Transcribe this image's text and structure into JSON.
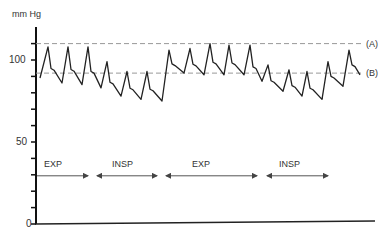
{
  "chart_data": {
    "type": "line",
    "title": "",
    "ylabel": "mm Hg",
    "xlabel": "",
    "ylim": [
      0,
      115
    ],
    "yticks": [
      0,
      10,
      20,
      30,
      40,
      50,
      60,
      70,
      80,
      90,
      100,
      110
    ],
    "ytick_labels": [
      {
        "value": 100,
        "label": "100"
      },
      {
        "value": 50,
        "label": "50"
      },
      {
        "value": 0,
        "label": "0"
      }
    ],
    "grid": false,
    "reference_lines": [
      {
        "name": "(A)",
        "value": 110,
        "style": "dashed"
      },
      {
        "name": "(B)",
        "value": 92,
        "style": "dashed"
      }
    ],
    "phases": [
      {
        "label": "EXP",
        "x_start": 37,
        "x_end": 88
      },
      {
        "label": "INSP",
        "x_start": 97,
        "x_end": 157
      },
      {
        "label": "EXP",
        "x_start": 166,
        "x_end": 257
      },
      {
        "label": "INSP",
        "x_start": 267,
        "x_end": 328
      }
    ],
    "phase_arrow_level": 30,
    "series": [
      {
        "name": "Arterial pressure",
        "peaks": [
          {
            "x": 48,
            "value": 108
          },
          {
            "x": 68,
            "value": 108
          },
          {
            "x": 88,
            "value": 108
          },
          {
            "x": 107,
            "value": 99
          },
          {
            "x": 127,
            "value": 93
          },
          {
            "x": 147,
            "value": 93
          },
          {
            "x": 169,
            "value": 106
          },
          {
            "x": 190,
            "value": 107
          },
          {
            "x": 210,
            "value": 110
          },
          {
            "x": 229,
            "value": 109
          },
          {
            "x": 250,
            "value": 109
          },
          {
            "x": 268,
            "value": 97
          },
          {
            "x": 289,
            "value": 94
          },
          {
            "x": 307,
            "value": 93
          },
          {
            "x": 328,
            "value": 99
          },
          {
            "x": 349,
            "value": 106
          }
        ],
        "troughs": [
          {
            "x": 40,
            "value": 89
          },
          {
            "x": 62,
            "value": 86
          },
          {
            "x": 82,
            "value": 85
          },
          {
            "x": 101,
            "value": 83
          },
          {
            "x": 121,
            "value": 78
          },
          {
            "x": 141,
            "value": 76
          },
          {
            "x": 162,
            "value": 75
          },
          {
            "x": 184,
            "value": 92
          },
          {
            "x": 204,
            "value": 91
          },
          {
            "x": 224,
            "value": 91
          },
          {
            "x": 244,
            "value": 91
          },
          {
            "x": 262,
            "value": 87
          },
          {
            "x": 283,
            "value": 81
          },
          {
            "x": 302,
            "value": 78
          },
          {
            "x": 322,
            "value": 76
          },
          {
            "x": 343,
            "value": 84
          },
          {
            "x": 360,
            "value": 91
          }
        ]
      }
    ]
  },
  "axis": {
    "y_unit_label": "mm Hg",
    "tick_100": "100",
    "tick_50": "50",
    "tick_0": "0"
  },
  "legend": {
    "line_a_label": "(A)",
    "line_b_label": "(B)"
  },
  "phases": {
    "p1": "EXP",
    "p2": "INSP",
    "p3": "EXP",
    "p4": "INSP"
  },
  "colors": {
    "trace": "#222222",
    "dashed": "#999999",
    "axis": "#111111",
    "arrow": "#555555"
  }
}
